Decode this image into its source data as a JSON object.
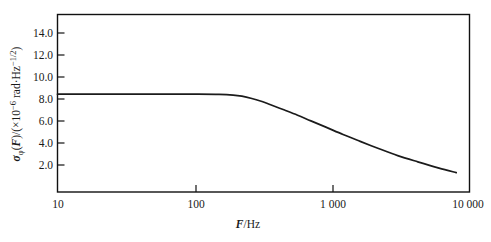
{
  "chart_data": {
    "type": "line",
    "title": "",
    "xlabel": "F/Hz",
    "xlabel_symbol": "F",
    "xlabel_unit": "/Hz",
    "ylabel": "σφ(F)/(×10−6 rad·Hz−1/2)",
    "ylabel_symbol": "σ",
    "ylabel_subscript": "φ",
    "ylabel_paren_var": "F",
    "ylabel_rest_a": ")/(×10",
    "ylabel_exp_a": "−6",
    "ylabel_rest_b": " rad·Hz",
    "ylabel_exp_b": "−1/2",
    "ylabel_rest_c": ")",
    "xscale": "log",
    "yscale": "linear",
    "xlim": [
      10,
      10000
    ],
    "ylim": [
      0,
      15.6
    ],
    "grid": false,
    "legend": null,
    "xticks": [
      10,
      100,
      1000,
      10000
    ],
    "xtick_labels": [
      "10",
      "100",
      "1 000",
      "10 000"
    ],
    "yticks": [
      2.0,
      4.0,
      6.0,
      8.0,
      10.0,
      12.0,
      14.0
    ],
    "ytick_labels": [
      "2.0",
      "4.0",
      "6.0",
      "8.0",
      "10.0",
      "12.0",
      "14.0"
    ],
    "series": [
      {
        "name": "phase noise",
        "color": "#1b1b1b",
        "x": [
          10,
          20,
          40,
          70,
          100,
          150,
          190,
          220,
          260,
          300,
          360,
          450,
          560,
          700,
          900,
          1200,
          1600,
          2200,
          3000,
          4200,
          6000,
          8000
        ],
        "y": [
          8.6,
          8.6,
          8.6,
          8.6,
          8.6,
          8.58,
          8.52,
          8.42,
          8.22,
          8.0,
          7.65,
          7.2,
          6.75,
          6.25,
          5.7,
          5.05,
          4.45,
          3.8,
          3.2,
          2.65,
          2.1,
          1.7
        ]
      }
    ],
    "annotations": {
      "plateau_value": 8.6,
      "knee_frequency": 190,
      "end_value": 1.7
    }
  },
  "figure": {
    "background": "#ffffff",
    "frame_color": "#111111",
    "text_color": "#1a1a1a"
  }
}
